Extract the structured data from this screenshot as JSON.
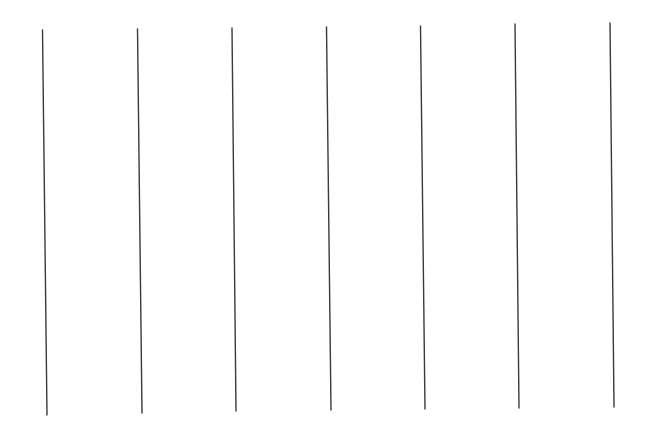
{
  "canvas": {
    "width": 655,
    "height": 427,
    "background": "#ffffff"
  },
  "stroke": {
    "color": "#3a3a3a",
    "width": 1.4
  },
  "lines": [
    {
      "x1": 42.5,
      "y1": 30,
      "x2": 47,
      "y2": 415
    },
    {
      "x1": 137.5,
      "y1": 29,
      "x2": 142,
      "y2": 413
    },
    {
      "x1": 232,
      "y1": 28,
      "x2": 236,
      "y2": 411
    },
    {
      "x1": 326.5,
      "y1": 27,
      "x2": 331,
      "y2": 410
    },
    {
      "x1": 420.5,
      "y1": 26,
      "x2": 425,
      "y2": 409
    },
    {
      "x1": 515,
      "y1": 24,
      "x2": 519,
      "y2": 408
    },
    {
      "x1": 610,
      "y1": 23,
      "x2": 614,
      "y2": 407
    }
  ]
}
